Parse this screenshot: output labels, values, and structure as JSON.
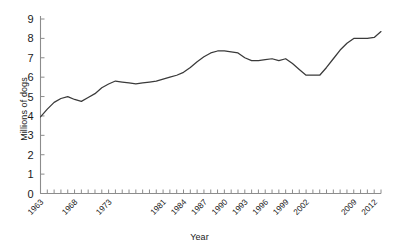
{
  "chart_data": {
    "type": "line",
    "title": "",
    "xlabel": "Year",
    "ylabel": "Millions of dogs",
    "ylim": [
      0,
      9
    ],
    "xlim": [
      1963,
      2013
    ],
    "grid": false,
    "legend": null,
    "ytick_labels": [
      "0",
      "1",
      "2",
      "3",
      "4",
      "5",
      "6",
      "7",
      "8",
      "9"
    ],
    "ytick_values": [
      0,
      1,
      2,
      3,
      4,
      5,
      6,
      7,
      8,
      9
    ],
    "xtick_labels": [
      "1963",
      "1968",
      "1973",
      "1981",
      "1984",
      "1987",
      "1990",
      "1993",
      "1996",
      "1999",
      "2002",
      "2009",
      "2012"
    ],
    "xtick_label_values": [
      1963,
      1968,
      1973,
      1981,
      1984,
      1987,
      1990,
      1993,
      1996,
      1999,
      2002,
      2009,
      2012
    ],
    "series": [
      {
        "name": "Millions of dogs",
        "x": [
          1963,
          1964,
          1965,
          1966,
          1967,
          1968,
          1969,
          1970,
          1971,
          1972,
          1973,
          1974,
          1975,
          1976,
          1977,
          1978,
          1979,
          1980,
          1981,
          1982,
          1983,
          1984,
          1985,
          1986,
          1987,
          1988,
          1989,
          1990,
          1991,
          1992,
          1993,
          1994,
          1995,
          1996,
          1997,
          1998,
          1999,
          2000,
          2001,
          2002,
          2003,
          2004,
          2005,
          2006,
          2007,
          2008,
          2009,
          2010,
          2011,
          2012,
          2013
        ],
        "values": [
          3.95,
          4.35,
          4.7,
          4.9,
          5.0,
          4.85,
          4.75,
          4.95,
          5.15,
          5.45,
          5.65,
          5.8,
          5.75,
          5.7,
          5.65,
          5.7,
          5.75,
          5.8,
          5.9,
          6.0,
          6.1,
          6.25,
          6.5,
          6.8,
          7.05,
          7.25,
          7.35,
          7.35,
          7.3,
          7.25,
          7.0,
          6.85,
          6.85,
          6.9,
          6.95,
          6.85,
          6.95,
          6.7,
          6.4,
          6.1,
          6.1,
          6.1,
          6.5,
          6.95,
          7.4,
          7.75,
          8.0,
          8.0,
          8.0,
          8.05,
          8.35
        ]
      }
    ]
  }
}
